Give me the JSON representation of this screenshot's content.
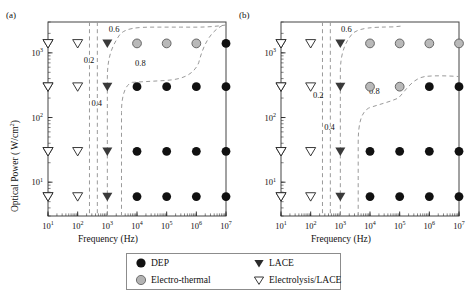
{
  "figure": {
    "panels": [
      {
        "tag": "(a)"
      },
      {
        "tag": "(b)"
      }
    ],
    "axes": {
      "xlabel": "Frequency (Hz)",
      "ylabel": "Optical Power ( W/cm",
      "ylabel_sup": "2",
      "ylabel_tail": ")",
      "xticks": [
        "10",
        "10",
        "10",
        "10",
        "10",
        "10",
        "10"
      ],
      "xtick_exps": [
        "1",
        "2",
        "3",
        "4",
        "5",
        "6",
        "7"
      ],
      "yticks": [
        "10",
        "10",
        "10"
      ],
      "ytick_exps": [
        "3",
        "2",
        "1"
      ]
    },
    "contour_labels": [
      "0.2",
      "0.4",
      "0.6",
      "0.8"
    ]
  },
  "legend": {
    "items": [
      {
        "label": "DEP",
        "symbol": "filled-circle",
        "color": "#111111"
      },
      {
        "label": "LACE",
        "symbol": "filled-triangle-down",
        "color": "#333333"
      },
      {
        "label": "Electro-thermal",
        "symbol": "gray-circle",
        "color": "#b3b3b3"
      },
      {
        "label": "Electrolysis/LACE",
        "symbol": "open-triangle-down",
        "color": "#ffffff"
      }
    ]
  },
  "chart_data": {
    "type": "scatter",
    "title": "",
    "xlabel": "Frequency (Hz)",
    "ylabel": "Optical Power (W/cm^2)",
    "xscale": "log",
    "yscale": "log",
    "xlim": [
      10,
      10000000
    ],
    "ylim": [
      3,
      3000
    ],
    "grid": false,
    "legend_position": "below-figure",
    "x": [
      10,
      100,
      1000,
      10000,
      100000,
      1000000,
      10000000
    ],
    "y_rows": [
      1400,
      300,
      30,
      6
    ],
    "categories": [
      "DEP",
      "Electro-thermal",
      "LACE",
      "Electrolysis/LACE"
    ],
    "panels": [
      {
        "tag": "(a)",
        "rows": [
          {
            "power": 1400,
            "markers": [
              "Electrolysis/LACE",
              "Electrolysis/LACE",
              "LACE",
              "Electro-thermal",
              "Electro-thermal",
              "Electro-thermal",
              "DEP"
            ]
          },
          {
            "power": 300,
            "markers": [
              "Electrolysis/LACE",
              "Electrolysis/LACE",
              "LACE",
              "DEP",
              "DEP",
              "DEP",
              "DEP"
            ]
          },
          {
            "power": 30,
            "markers": [
              "Electrolysis/LACE",
              "Electrolysis/LACE",
              "LACE",
              "DEP",
              "DEP",
              "DEP",
              "DEP"
            ]
          },
          {
            "power": 6,
            "markers": [
              "Electrolysis/LACE",
              "Electrolysis/LACE",
              "LACE",
              "DEP",
              "DEP",
              "DEP",
              "DEP"
            ]
          }
        ],
        "contours": [
          {
            "label": "0.2",
            "label_x": 240,
            "label_y": 700
          },
          {
            "label": "0.4",
            "label_x": 440,
            "label_y": 150
          },
          {
            "label": "0.6",
            "label_x": 1700,
            "label_y": 2100
          },
          {
            "label": "0.8",
            "label_x": 13000,
            "label_y": 620
          }
        ]
      },
      {
        "tag": "(b)",
        "rows": [
          {
            "power": 1400,
            "markers": [
              "Electrolysis/LACE",
              "Electrolysis/LACE",
              "LACE",
              "Electro-thermal",
              "Electro-thermal",
              "Electro-thermal",
              "Electro-thermal"
            ]
          },
          {
            "power": 300,
            "markers": [
              "Electrolysis/LACE",
              "Electrolysis/LACE",
              "LACE",
              "Electro-thermal",
              "Electro-thermal",
              "DEP",
              "DEP"
            ]
          },
          {
            "power": 30,
            "markers": [
              "Electrolysis/LACE",
              "Electrolysis/LACE",
              "LACE",
              "DEP",
              "DEP",
              "DEP",
              "DEP"
            ]
          },
          {
            "power": 6,
            "markers": [
              "Electrolysis/LACE",
              "Electrolysis/LACE",
              "LACE",
              "DEP",
              "DEP",
              "DEP",
              "DEP"
            ]
          }
        ],
        "contours": [
          {
            "label": "0.2",
            "label_x": 180,
            "label_y": 200
          },
          {
            "label": "0.4",
            "label_x": 430,
            "label_y": 65
          },
          {
            "label": "0.6",
            "label_x": 1600,
            "label_y": 2100
          },
          {
            "label": "0.8",
            "label_x": 14000,
            "label_y": 230
          }
        ]
      }
    ]
  }
}
